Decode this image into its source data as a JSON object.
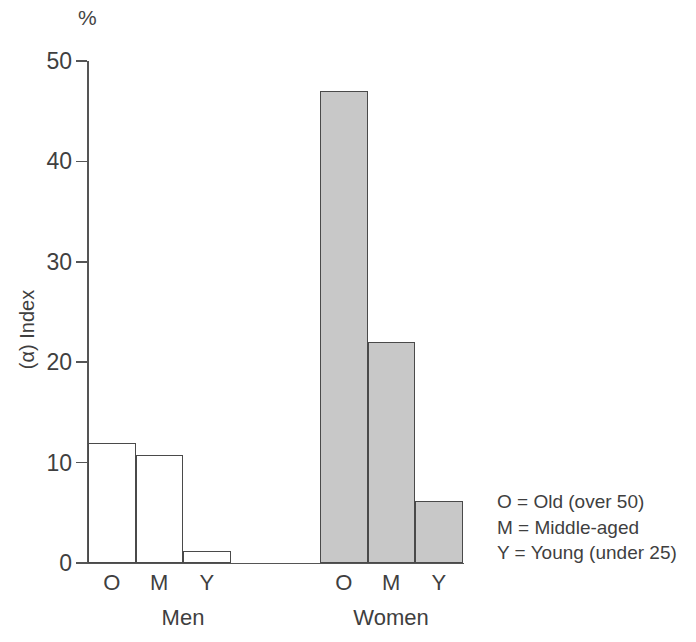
{
  "chart_data": {
    "type": "bar",
    "title": "",
    "xlabel": "",
    "ylabel": "(α) Index",
    "unit_label": "%",
    "ylim": [
      0,
      50
    ],
    "yticks": [
      0,
      10,
      20,
      30,
      40,
      50
    ],
    "grid": false,
    "legend_position": "right-inside",
    "categories": [
      "O",
      "M",
      "Y"
    ],
    "groups": [
      "Men",
      "Women"
    ],
    "series": [
      {
        "name": "Men",
        "values": [
          12,
          10.8,
          1.2
        ],
        "fill": "#ffffff",
        "stroke": "#4a4a4a"
      },
      {
        "name": "Women",
        "values": [
          47,
          22,
          6.2
        ],
        "fill": "#c8c8c8",
        "stroke": "#4a4a4a"
      }
    ],
    "bars": [
      {
        "group": "Men",
        "category": "O",
        "value": 12,
        "style": "men"
      },
      {
        "group": "Men",
        "category": "M",
        "value": 10.8,
        "style": "men"
      },
      {
        "group": "Men",
        "category": "Y",
        "value": 1.2,
        "style": "men"
      },
      {
        "group": "Women",
        "category": "O",
        "value": 47,
        "style": "women"
      },
      {
        "group": "Women",
        "category": "M",
        "value": 22,
        "style": "women"
      },
      {
        "group": "Women",
        "category": "Y",
        "value": 6.2,
        "style": "women"
      }
    ],
    "legend_entries": [
      "O = Old (over 50)",
      "M = Middle-aged",
      "Y = Young (under 25)"
    ]
  },
  "axis": {
    "tick_labels": [
      "0",
      "10",
      "20",
      "30",
      "40",
      "50"
    ],
    "unit": "%",
    "title": "(α) Index"
  },
  "categories": {
    "men": {
      "label": "Men",
      "ticks": [
        "O",
        "M",
        "Y"
      ]
    },
    "women": {
      "label": "Women",
      "ticks": [
        "O",
        "M",
        "Y"
      ]
    }
  },
  "legend": {
    "line1": "O = Old (over 50)",
    "line2": "M = Middle-aged",
    "line3": "Y = Young (under 25)"
  }
}
